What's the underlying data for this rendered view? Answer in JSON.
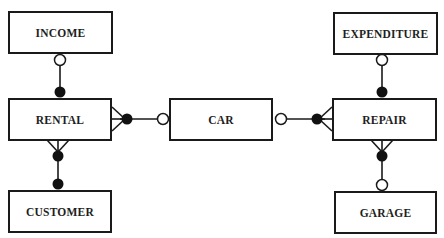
{
  "diagram": {
    "type": "entity-relationship",
    "notation": "crow's foot",
    "entities": [
      {
        "id": "income",
        "label": "INCOME"
      },
      {
        "id": "rental",
        "label": "RENTAL"
      },
      {
        "id": "customer",
        "label": "CUSTOMER"
      },
      {
        "id": "car",
        "label": "CAR"
      },
      {
        "id": "expenditure",
        "label": "EXPENDITURE"
      },
      {
        "id": "repair",
        "label": "REPAIR"
      },
      {
        "id": "garage",
        "label": "GARAGE"
      }
    ],
    "relationships": [
      {
        "from": "income",
        "to": "rental",
        "from_end": "optional-one",
        "to_end": "mandatory-one"
      },
      {
        "from": "rental",
        "to": "car",
        "from_end": "mandatory-many",
        "to_end": "optional-one"
      },
      {
        "from": "rental",
        "to": "customer",
        "from_end": "mandatory-many",
        "to_end": "mandatory-one"
      },
      {
        "from": "car",
        "to": "repair",
        "from_end": "optional-one",
        "to_end": "mandatory-many"
      },
      {
        "from": "expenditure",
        "to": "repair",
        "from_end": "optional-one",
        "to_end": "mandatory-one"
      },
      {
        "from": "repair",
        "to": "garage",
        "from_end": "mandatory-many",
        "to_end": "optional-one"
      }
    ]
  }
}
